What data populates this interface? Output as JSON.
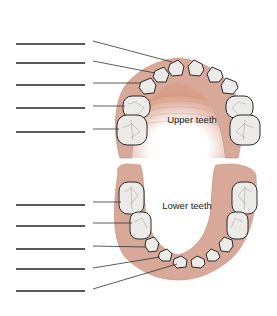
{
  "diagram": {
    "upper_label": "Upper teeth",
    "lower_label": "Lower teeth",
    "colors": {
      "gum": "#d8a898",
      "gum_dark": "#c48a78",
      "tooth": "#ecebe7",
      "tooth_outline": "#2a2a2a",
      "line": "#333333",
      "blank": "#222222"
    },
    "upper_blanks": [
      {
        "index": 1,
        "points_to": "central incisor"
      },
      {
        "index": 2,
        "points_to": "lateral incisor"
      },
      {
        "index": 3,
        "points_to": "canine"
      },
      {
        "index": 4,
        "points_to": "first molar"
      },
      {
        "index": 5,
        "points_to": "second molar"
      }
    ],
    "lower_blanks": [
      {
        "index": 6,
        "points_to": "second molar"
      },
      {
        "index": 7,
        "points_to": "first molar"
      },
      {
        "index": 8,
        "points_to": "canine"
      },
      {
        "index": 9,
        "points_to": "lateral incisor"
      },
      {
        "index": 10,
        "points_to": "central incisor"
      }
    ]
  }
}
